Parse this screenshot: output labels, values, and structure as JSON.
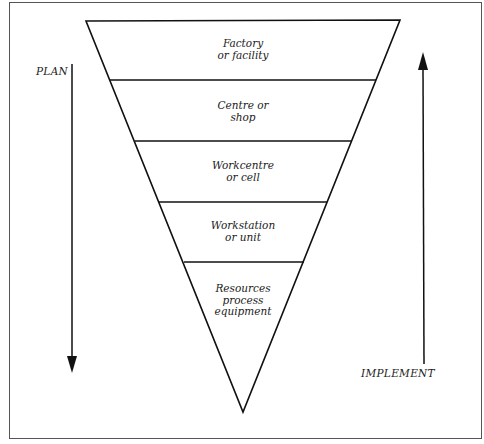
{
  "diagram": {
    "type": "inverted-pyramid",
    "levels": [
      {
        "label": "Factory\nor facility"
      },
      {
        "label": "Centre or\nshop"
      },
      {
        "label": "Workcentre\nor cell"
      },
      {
        "label": "Workstation\nor unit"
      },
      {
        "label": "Resources\nprocess\nequipment"
      }
    ],
    "left_arrow": {
      "label": "PLAN",
      "direction": "down"
    },
    "right_arrow": {
      "label": "IMPLEMENT",
      "direction": "up"
    },
    "colors": {
      "line": "#111111",
      "frame": "#555555",
      "background": "#ffffff"
    }
  }
}
